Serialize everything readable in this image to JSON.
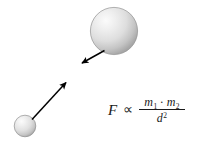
{
  "figure": {
    "background_color": "#ffffff",
    "width": 207,
    "height": 145
  },
  "bodies": [
    {
      "name": "large-mass-sphere",
      "label": "m2",
      "cx": 114,
      "cy": 31,
      "r": 24,
      "fill_light": "#f2f2f2",
      "fill_mid": "#d8d8d8",
      "fill_dark": "#a8a8a8",
      "outline": "#8c8c8c"
    },
    {
      "name": "small-mass-sphere",
      "label": "m1",
      "cx": 25,
      "cy": 126,
      "r": 11,
      "fill_light": "#f4f4f4",
      "fill_mid": "#dcdcdc",
      "fill_dark": "#acacac",
      "outline": "#8c8c8c"
    }
  ],
  "force_arrows": [
    {
      "name": "force-arrow-on-large-mass",
      "direction": "down-left",
      "x1": 104,
      "y1": 50,
      "x2": 80,
      "y2": 64,
      "color": "#000000"
    },
    {
      "name": "force-arrow-on-small-mass",
      "direction": "up-right",
      "x1": 33,
      "y1": 119,
      "x2": 68,
      "y2": 81,
      "color": "#000000"
    }
  ],
  "formula": {
    "force_symbol": "F",
    "proportional_symbol": "∝",
    "numerator": {
      "mass1": "m",
      "mass1_subscript": "1",
      "dot": "·",
      "mass2": "m",
      "mass2_subscript": "2"
    },
    "denominator": {
      "distance": "d",
      "exponent": "2"
    },
    "plain_text": "F ∝ m1 · m2 / d²",
    "text_color": "#1a1a1a"
  }
}
